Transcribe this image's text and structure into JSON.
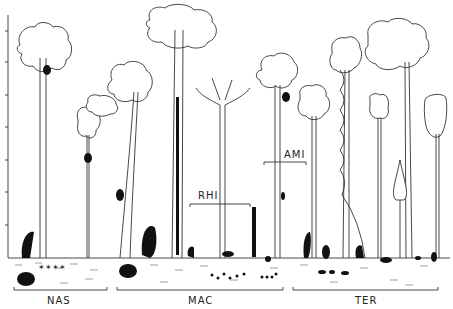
{
  "figure": {
    "type": "forest-profile-diagram",
    "y_axis": {
      "tick_count": 9,
      "tick_labels": []
    },
    "zones": [
      {
        "id": "nas",
        "label": "NAS",
        "x_start": 14,
        "x_end": 107
      },
      {
        "id": "mac",
        "label": "MAC",
        "x_start": 117,
        "x_end": 283
      },
      {
        "id": "ter",
        "label": "TER",
        "x_start": 293,
        "x_end": 438
      }
    ],
    "annotations": [
      {
        "id": "rhi",
        "label": "RHI"
      },
      {
        "id": "ami",
        "label": "AMI"
      }
    ],
    "colors": {
      "line": "#333333",
      "fill": "#111111",
      "background": "#ffffff"
    }
  }
}
